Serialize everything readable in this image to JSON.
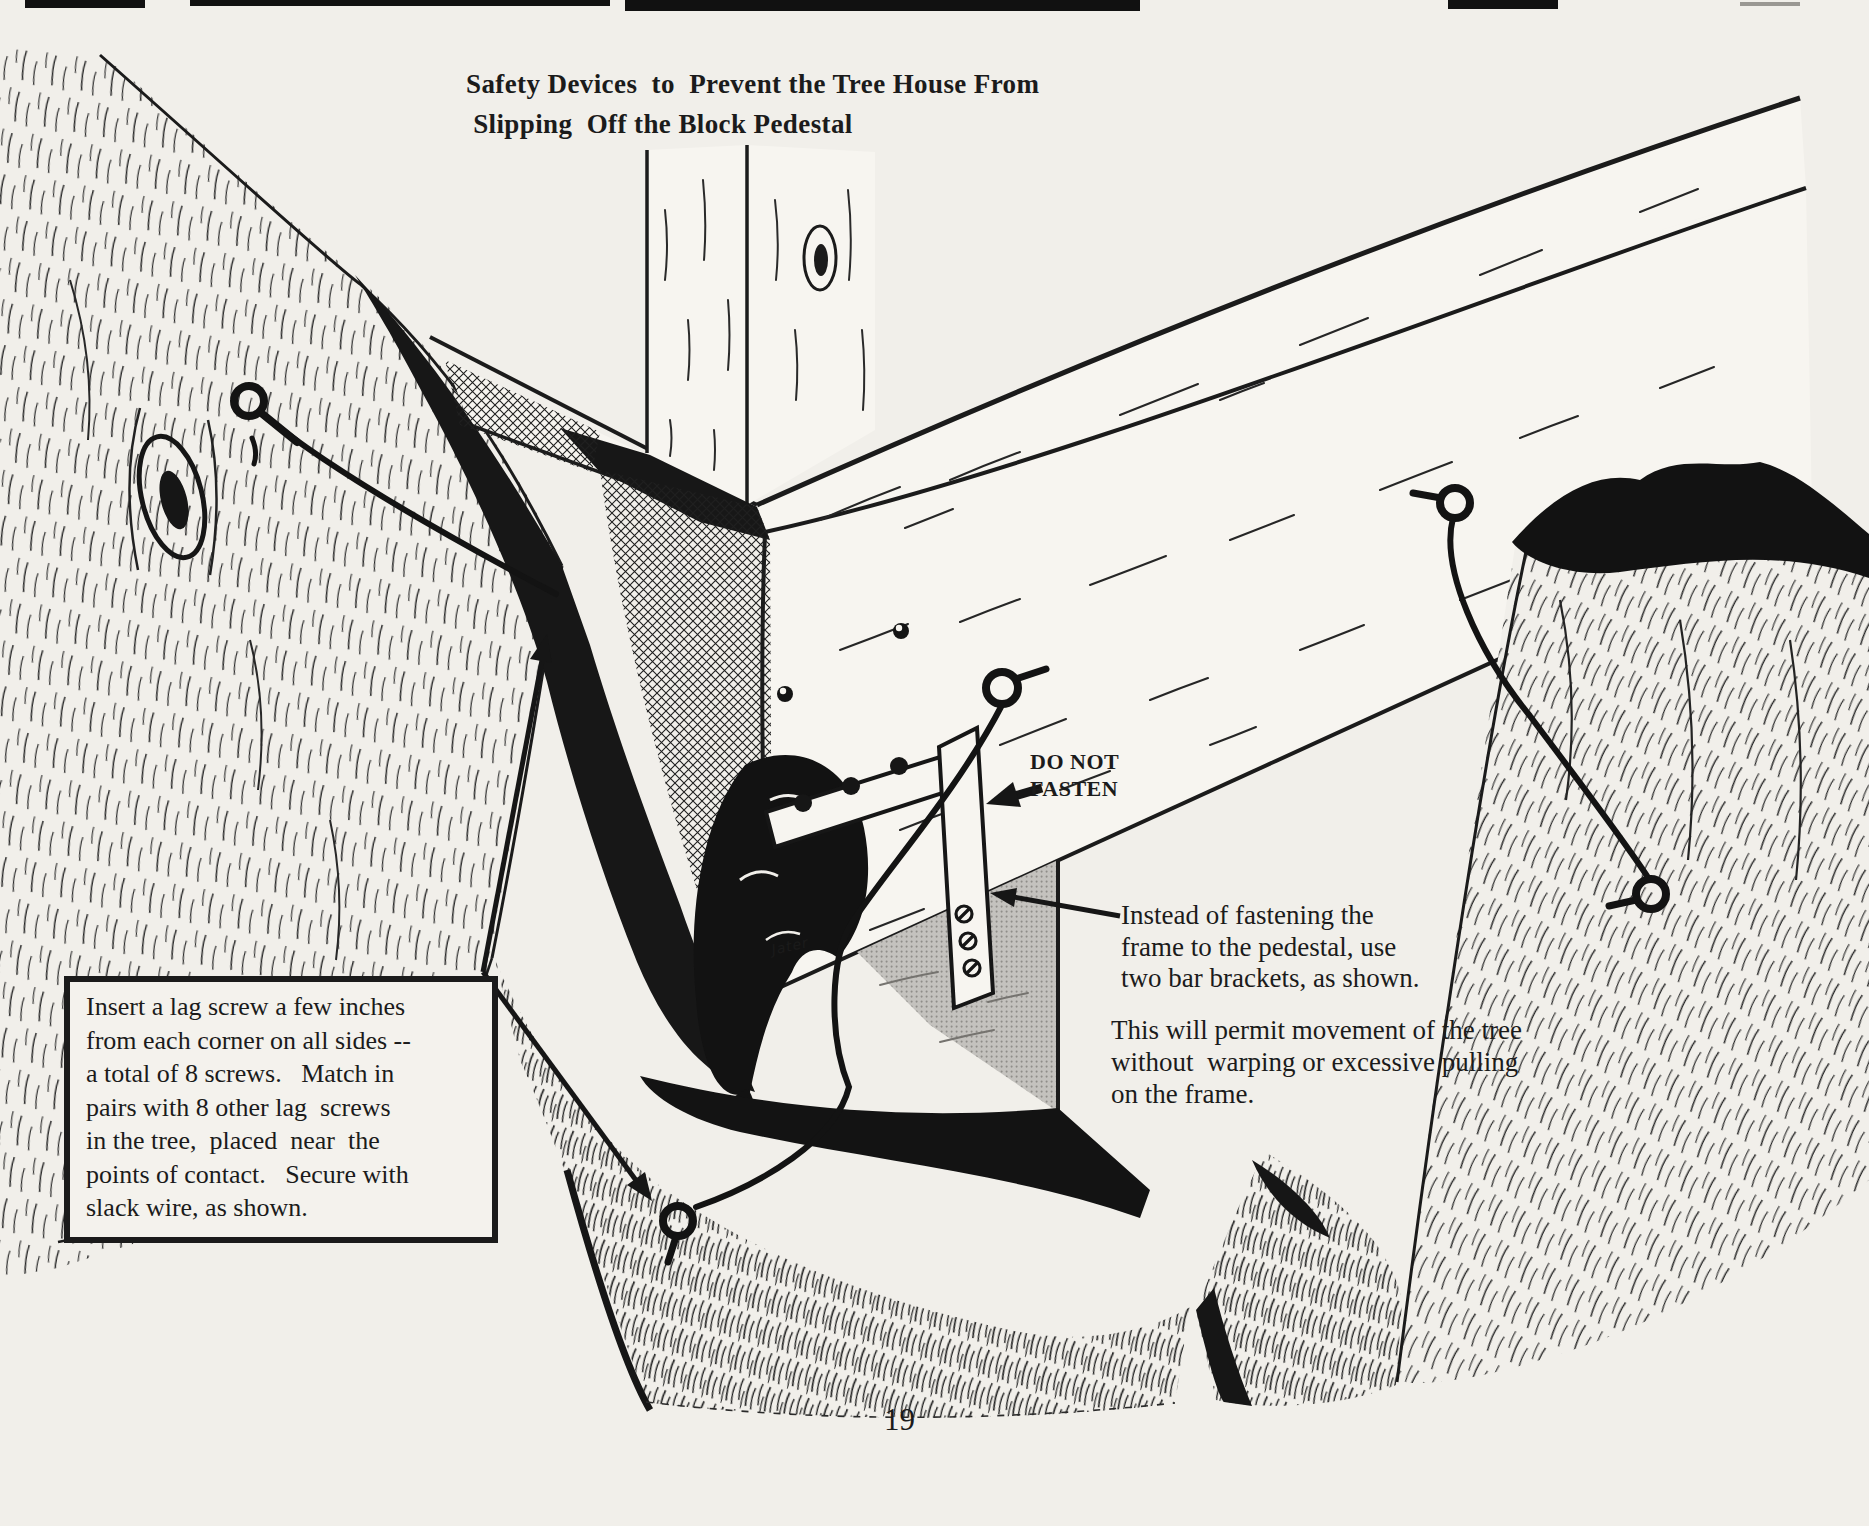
{
  "figure": {
    "title": "Safety Devices  to  Prevent the Tree House From\n Slipping  Off the Block Pedestal",
    "instruction_box": "Insert a lag screw a few inches\nfrom each corner on all sides --\na total of 8 screws.   Match in\npairs with 8 other lag  screws\nin the tree,  placed  near  the\npoints of contact.   Secure with\nslack wire, as shown.",
    "do_not_fasten": "DO NOT\nFASTEN",
    "caption_brackets": "Instead of fastening the\nframe to the pedestal, use\ntwo bar brackets, as shown.",
    "caption_movement": "This will permit movement of the tree\nwithout  warping or excessive pulling\non the frame.",
    "artist_signature": "Jater",
    "page_number": "19",
    "colors": {
      "ink": "#1b1b1b",
      "paper": "#f1efea",
      "wood": "#f7f5f0",
      "pedestal_shade": "#c4c2be"
    }
  }
}
